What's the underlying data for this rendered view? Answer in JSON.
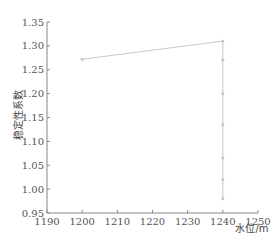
{
  "chart_data": {
    "type": "line",
    "title": "",
    "xlabel": "水位/m",
    "ylabel": "稳定性系数",
    "xlim": [
      1190,
      1250
    ],
    "ylim": [
      0.95,
      1.35
    ],
    "x_ticks": [
      "1190",
      "1200",
      "1210",
      "1220",
      "1230",
      "1240",
      "1250"
    ],
    "y_ticks": [
      "0.95",
      "1.00",
      "1.05",
      "1.10",
      "1.15",
      "1.20",
      "1.25",
      "1.30",
      "1.35"
    ],
    "grid": false,
    "legend": null,
    "series": [
      {
        "name": "稳定性系数",
        "color": "#c8c8c8",
        "points": [
          {
            "x": 1200,
            "y": 1.272
          },
          {
            "x": 1240,
            "y": 1.31
          },
          {
            "x": 1240,
            "y": 1.27
          },
          {
            "x": 1240,
            "y": 1.2
          },
          {
            "x": 1240,
            "y": 1.135
          },
          {
            "x": 1240,
            "y": 1.065
          },
          {
            "x": 1240,
            "y": 1.02
          },
          {
            "x": 1240,
            "y": 0.98
          }
        ]
      }
    ]
  },
  "axes": {
    "x_title": "水位/m",
    "y_title": "稳定性系数"
  }
}
